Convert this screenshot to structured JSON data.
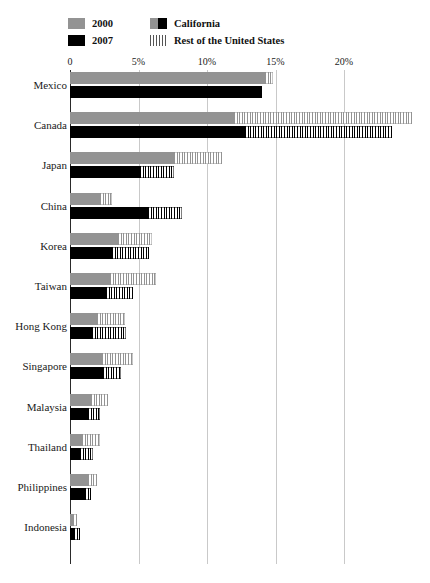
{
  "legend": {
    "items": [
      {
        "id": "legend-2000",
        "label": "2000",
        "swatch": "grey-square"
      },
      {
        "id": "legend-2007",
        "label": "2007",
        "swatch": "black-square"
      },
      {
        "id": "legend-california",
        "label": "California",
        "swatch": "solid-split-square"
      },
      {
        "id": "legend-rest-of-us",
        "label": "Rest of the United States",
        "swatch": "hatched-square"
      }
    ]
  },
  "chart_data": {
    "type": "bar",
    "orientation": "horizontal",
    "title": "",
    "xlabel": "",
    "ylabel": "",
    "xlim": [
      0,
      22.5
    ],
    "xticks": [
      0,
      5,
      10,
      15,
      20
    ],
    "xticklabels": [
      "0",
      "5%",
      "10%",
      "15%",
      "20%"
    ],
    "grid": true,
    "legend_position": "top-left",
    "stacked": true,
    "stack_components": [
      "California",
      "Rest of the United States"
    ],
    "categories": [
      "Mexico",
      "Canada",
      "Japan",
      "China",
      "Korea",
      "Taiwan",
      "Hong Kong",
      "Singapore",
      "Malaysia",
      "Thailand",
      "Philippines",
      "Indonesia"
    ],
    "series": [
      {
        "name": "2000",
        "california": [
          14.2,
          12.0,
          7.6,
          2.2,
          3.5,
          2.9,
          2.0,
          2.3,
          1.5,
          0.9,
          1.3,
          0.2
        ],
        "rest_of_us": [
          0.6,
          13.0,
          3.5,
          0.9,
          2.5,
          3.4,
          2.0,
          2.3,
          1.3,
          1.3,
          0.7,
          0.3
        ],
        "total": [
          14.8,
          25.0,
          11.1,
          3.1,
          6.0,
          6.3,
          4.0,
          4.6,
          2.8,
          2.2,
          2.0,
          0.5
        ]
      },
      {
        "name": "2007",
        "california": [
          14.0,
          12.8,
          5.1,
          5.7,
          3.1,
          2.6,
          1.6,
          2.4,
          1.3,
          0.7,
          1.1,
          0.3
        ],
        "rest_of_us": [
          0.0,
          10.7,
          2.5,
          2.5,
          2.7,
          2.0,
          2.5,
          1.3,
          0.9,
          1.0,
          0.4,
          0.4
        ],
        "total": [
          14.0,
          23.5,
          7.6,
          8.2,
          5.8,
          4.6,
          4.1,
          3.7,
          2.2,
          1.7,
          1.5,
          0.7
        ]
      }
    ]
  }
}
